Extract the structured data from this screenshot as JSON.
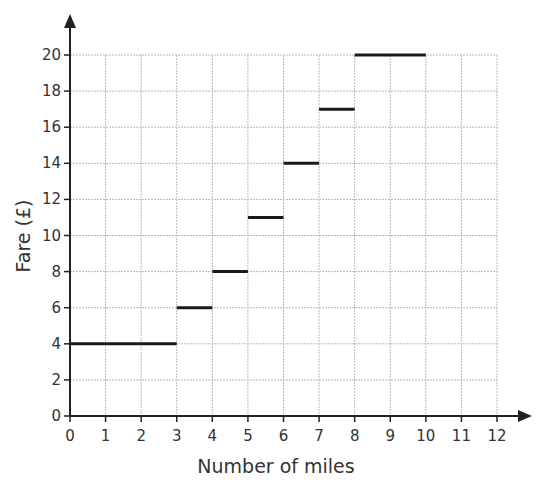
{
  "chart_data": {
    "type": "line",
    "subtype": "step",
    "title": "",
    "xlabel": "Number of miles",
    "ylabel": "Fare (£)",
    "xlim": [
      0,
      12
    ],
    "ylim": [
      0,
      20
    ],
    "x_ticks": [
      0,
      1,
      2,
      3,
      4,
      5,
      6,
      7,
      8,
      9,
      10,
      11,
      12
    ],
    "y_ticks": [
      0,
      2,
      4,
      6,
      8,
      10,
      12,
      14,
      16,
      18,
      20
    ],
    "grid": true,
    "legend": null,
    "series": [
      {
        "name": "Fare",
        "segments": [
          {
            "x_start": 0,
            "x_end": 3,
            "y": 4
          },
          {
            "x_start": 3,
            "x_end": 4,
            "y": 6
          },
          {
            "x_start": 4,
            "x_end": 5,
            "y": 8
          },
          {
            "x_start": 5,
            "x_end": 6,
            "y": 11
          },
          {
            "x_start": 6,
            "x_end": 7,
            "y": 14
          },
          {
            "x_start": 7,
            "x_end": 8,
            "y": 17
          },
          {
            "x_start": 8,
            "x_end": 10,
            "y": 20
          }
        ]
      }
    ]
  },
  "colors": {
    "axis": "#222222",
    "grid": "#b8b8b8",
    "step_line": "#1a1a1a",
    "text": "#333333"
  }
}
